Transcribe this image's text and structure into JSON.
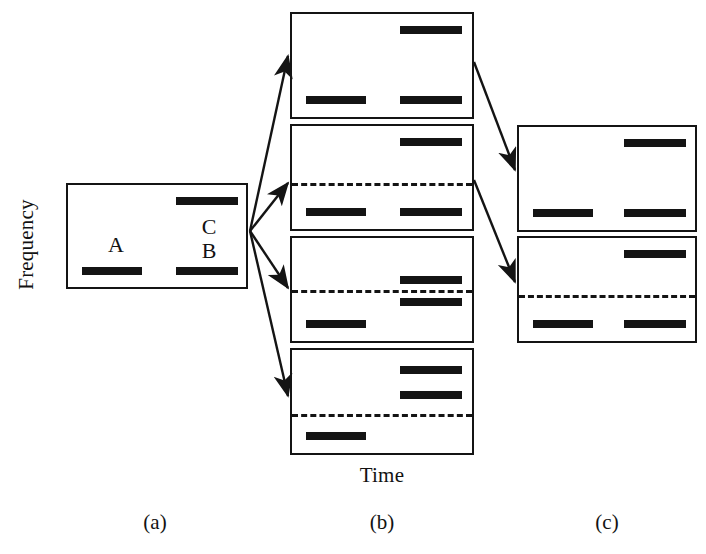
{
  "figure": {
    "axes": {
      "y_label": "Frequency",
      "x_label": "Time"
    },
    "captions": {
      "a": "(a)",
      "b": "(b)",
      "c": "(c)"
    },
    "colors": {
      "bar": "#141414",
      "border": "#141414",
      "background": "#ffffff",
      "text": "#121212"
    }
  },
  "chart_data": {
    "type": "diagram",
    "title": "",
    "xlabel": "Time",
    "ylabel": "Frequency",
    "groups": [
      {
        "id": "a",
        "caption": "(a)",
        "panels": [
          {
            "id": "a1",
            "rect": {
              "x": 66,
              "y": 183,
              "w": 182,
              "h": 106
            },
            "dashed_line": null,
            "bars": [
              {
                "name": "A",
                "x": 14,
                "y": 80,
                "w": 60
              },
              {
                "name": "B",
                "x": 108,
                "y": 80,
                "w": 62
              },
              {
                "name": "C",
                "x": 108,
                "y": 12,
                "w": 62
              }
            ],
            "letters": [
              {
                "text": "A",
                "x": 28,
                "y": 46
              },
              {
                "text": "C",
                "x": 121,
                "y": 28
              },
              {
                "text": "B",
                "x": 121,
                "y": 52
              }
            ]
          }
        ]
      },
      {
        "id": "b",
        "caption": "(b)",
        "panels": [
          {
            "id": "b1",
            "rect": {
              "x": 290,
              "y": 12,
              "w": 184,
              "h": 107
            },
            "dashed_line": null,
            "bars": [
              {
                "name": "low-left",
                "x": 14,
                "y": 80,
                "w": 60
              },
              {
                "name": "low-right",
                "x": 108,
                "y": 80,
                "w": 62
              },
              {
                "name": "high-right",
                "x": 108,
                "y": 12,
                "w": 62
              }
            ],
            "letters": []
          },
          {
            "id": "b2",
            "rect": {
              "x": 290,
              "y": 124,
              "w": 184,
              "h": 107
            },
            "dashed_line": {
              "y": 55
            },
            "bars": [
              {
                "name": "low-left",
                "x": 14,
                "y": 80,
                "w": 60
              },
              {
                "name": "low-right",
                "x": 108,
                "y": 80,
                "w": 62
              },
              {
                "name": "high-right",
                "x": 108,
                "y": 12,
                "w": 62
              }
            ],
            "letters": []
          },
          {
            "id": "b3",
            "rect": {
              "x": 290,
              "y": 236,
              "w": 184,
              "h": 107
            },
            "dashed_line": {
              "y": 50
            },
            "bars": [
              {
                "name": "low-left",
                "x": 14,
                "y": 80,
                "w": 60
              },
              {
                "name": "below-threshold",
                "x": 108,
                "y": 58,
                "w": 62
              },
              {
                "name": "above-threshold",
                "x": 108,
                "y": 37,
                "w": 62
              }
            ],
            "letters": []
          },
          {
            "id": "b4",
            "rect": {
              "x": 290,
              "y": 348,
              "w": 184,
              "h": 107
            },
            "dashed_line": {
              "y": 62
            },
            "bars": [
              {
                "name": "low-left",
                "x": 14,
                "y": 80,
                "w": 60
              },
              {
                "name": "mid-right",
                "x": 108,
                "y": 40,
                "w": 62
              },
              {
                "name": "high-right",
                "x": 108,
                "y": 16,
                "w": 62
              }
            ],
            "letters": []
          }
        ]
      },
      {
        "id": "c",
        "caption": "(c)",
        "panels": [
          {
            "id": "c1",
            "rect": {
              "x": 517,
              "y": 125,
              "w": 180,
              "h": 107
            },
            "dashed_line": null,
            "bars": [
              {
                "name": "low-left",
                "x": 14,
                "y": 80,
                "w": 60
              },
              {
                "name": "low-right",
                "x": 105,
                "y": 80,
                "w": 62
              },
              {
                "name": "high-right",
                "x": 105,
                "y": 12,
                "w": 62
              }
            ],
            "letters": []
          },
          {
            "id": "c2",
            "rect": {
              "x": 517,
              "y": 236,
              "w": 180,
              "h": 107
            },
            "dashed_line": {
              "y": 55
            },
            "bars": [
              {
                "name": "low-left",
                "x": 14,
                "y": 80,
                "w": 60
              },
              {
                "name": "low-right",
                "x": 105,
                "y": 80,
                "w": 62
              },
              {
                "name": "high-right",
                "x": 105,
                "y": 12,
                "w": 62
              }
            ],
            "letters": []
          }
        ]
      }
    ],
    "arrows": [
      {
        "name": "a-to-b1",
        "from": [
          250,
          231
        ],
        "to": [
          288,
          56
        ]
      },
      {
        "name": "a-to-b2",
        "from": [
          250,
          231
        ],
        "to": [
          288,
          183
        ]
      },
      {
        "name": "a-to-b3",
        "from": [
          250,
          231
        ],
        "to": [
          288,
          288
        ]
      },
      {
        "name": "a-to-b4",
        "from": [
          250,
          231
        ],
        "to": [
          288,
          396
        ]
      },
      {
        "name": "b1-to-c1",
        "from": [
          474,
          62
        ],
        "to": [
          515,
          170
        ]
      },
      {
        "name": "b2-to-c2",
        "from": [
          474,
          180
        ],
        "to": [
          515,
          282
        ]
      }
    ]
  }
}
